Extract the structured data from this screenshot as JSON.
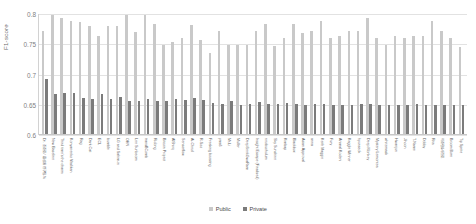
{
  "chart_data": {
    "type": "bar",
    "title": "",
    "xlabel": "",
    "ylabel": "F1-score",
    "ylim": [
      0.6,
      0.8
    ],
    "yticks": [
      0.6,
      0.65,
      0.7,
      0.75,
      0.8
    ],
    "ytick_labels": [
      "0.6",
      "0.65",
      "0.7",
      "0.75",
      "0.8"
    ],
    "grid": true,
    "legend_position": "bottom-center",
    "legend": [
      "Public",
      "Private"
    ],
    "colors": {
      "public": "#c9c9c9",
      "private": "#7b7b7b",
      "grid": "#e2e2e2",
      "axis": "#c8c8c8",
      "text": "#6b6b6b"
    },
    "categories": [
      "Dr. 조준호 / 황성원 연구팀-%",
      "New Baseline",
      "Third time's the charm",
      "Konyanenko Vitalikan",
      "Rag",
      "Dark Cat",
      "ECL",
      "bumble",
      "LG and Sahim-in",
      "OHN",
      "Lee Sunbeom",
      "transBComb",
      "Ridong",
      "Bitcoin Project",
      "AlShirq",
      "Sensorflow",
      "Ai-Cheol",
      "R-Soo",
      "Freaking boosting",
      "yms6",
      "Mr.Li",
      "Muller",
      "DeepSeekGwaRam",
      "Insight Escape (Finalised)",
      "neobuchulum",
      "Sky Sunshine",
      "Kimbap",
      "Blackbox",
      "Asian Approval",
      "anna",
      "Keith Maggie",
      "Fury",
      "Animal Kodeni",
      "Kaggle Winner",
      "hyunseok",
      "Deep Monkey",
      "Mystery Lemontea",
      "whitemask",
      "Hwanjun",
      "Jihoon",
      "T-Name",
      "Dobby",
      "Rita",
      "이준형&서진호",
      "Broom Born",
      "Tip Sprite"
    ],
    "series": [
      {
        "name": "Public",
        "values": [
          0.772,
          0.799,
          0.793,
          0.788,
          0.787,
          0.781,
          0.764,
          0.781,
          0.78,
          0.799,
          0.77,
          0.799,
          0.784,
          0.748,
          0.754,
          0.76,
          0.782,
          0.757,
          0.735,
          0.772,
          0.748,
          0.748,
          0.748,
          0.772,
          0.783,
          0.747,
          0.76,
          0.784,
          0.768,
          0.772,
          0.789,
          0.76,
          0.764,
          0.772,
          0.772,
          0.793,
          0.76,
          0.748,
          0.764,
          0.76,
          0.764,
          0.764,
          0.788,
          0.772,
          0.76,
          0.745
        ]
      },
      {
        "name": "Private",
        "values": [
          0.692,
          0.668,
          0.67,
          0.669,
          0.661,
          0.659,
          0.668,
          0.66,
          0.663,
          0.656,
          0.656,
          0.66,
          0.656,
          0.657,
          0.66,
          0.658,
          0.662,
          0.658,
          0.653,
          0.652,
          0.657,
          0.65,
          0.652,
          0.655,
          0.652,
          0.652,
          0.653,
          0.651,
          0.65,
          0.651,
          0.652,
          0.65,
          0.65,
          0.65,
          0.651,
          0.652,
          0.65,
          0.65,
          0.65,
          0.65,
          0.651,
          0.65,
          0.65,
          0.65,
          0.65,
          0.65
        ]
      }
    ]
  }
}
